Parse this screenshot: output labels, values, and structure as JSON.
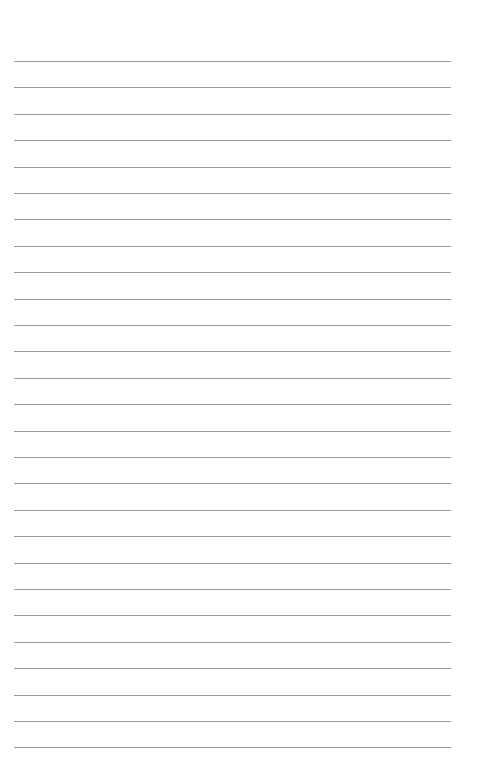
{
  "page": {
    "type": "lined-paper",
    "background": "#ffffff",
    "line_color": "#9a9a9a",
    "line_count": 27,
    "first_line_y": 61,
    "line_spacing": 26.4,
    "margin_left": 14,
    "line_width": 437
  }
}
